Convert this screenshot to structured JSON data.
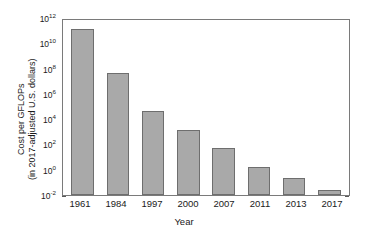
{
  "chart_data": {
    "type": "bar",
    "title": "",
    "subtitle": "",
    "xlabel": "Year",
    "ylabel_line1": "Cost per GFLOPs",
    "ylabel_line2": "(in 2017-adjusted U.S. dollars)",
    "categories": [
      "1961",
      "1984",
      "1997",
      "2000",
      "2007",
      "2011",
      "2013",
      "2017"
    ],
    "values": [
      130000000000.0,
      48000000.0,
      42000.0,
      1500.0,
      50.0,
      1.7,
      0.22,
      0.025
    ],
    "value_labels": [
      "1.3×10^11",
      "4.8×10^7",
      "4.2×10^4",
      "1.5×10^3",
      "5.0×10^1",
      "1.7",
      "2.2×10^-1",
      "2.5×10^-2"
    ],
    "yscale": "log",
    "ylim": [
      0.01,
      1000000000000.0
    ],
    "ylim_labels": [
      "10^-2",
      "10^12"
    ],
    "yticks": [
      0.01,
      1,
      100,
      10000,
      1000000,
      100000000,
      10000000000,
      1000000000000
    ],
    "ytick_mantissas": [
      "10",
      "10",
      "10",
      "10",
      "10",
      "10",
      "10",
      "10"
    ],
    "ytick_exponents": [
      "-2",
      "0",
      "2",
      "4",
      "6",
      "8",
      "10",
      "12"
    ],
    "grid": false,
    "legend": null,
    "bar_fill_color": "#a9a9a9",
    "bar_edge_color": "#6e6e6e",
    "axis_color": "#7a7a7a",
    "background_color": "#ffffff",
    "text_color": "#1a1a1a"
  }
}
